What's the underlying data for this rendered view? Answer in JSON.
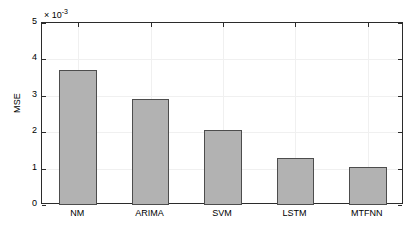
{
  "chart_data": {
    "type": "bar",
    "title": "",
    "xlabel": "",
    "ylabel": "MSE",
    "categories": [
      "NM",
      "ARIMA",
      "SVM",
      "LSTM",
      "MTFNN"
    ],
    "values": [
      0.0037,
      0.0029,
      0.00205,
      0.0013,
      0.00105
    ],
    "values_scaled": [
      3.7,
      2.9,
      2.05,
      1.3,
      1.05
    ],
    "y_exponent_label": "× 10",
    "y_exponent_power": "-3",
    "y_scale_factor": 0.001,
    "ylim": [
      0,
      5
    ],
    "ytick_labels": [
      "0",
      "1",
      "2",
      "3",
      "4",
      "5"
    ],
    "ytick_values": [
      0,
      1,
      2,
      3,
      4,
      5
    ],
    "grid": true,
    "legend": "none",
    "bar_color": "#b2b2b2",
    "bar_edge_color": "#4d4d4d",
    "axis_color": "#2b2b2b",
    "grid_color": "#f0f0f0",
    "background": "#ffffff"
  }
}
